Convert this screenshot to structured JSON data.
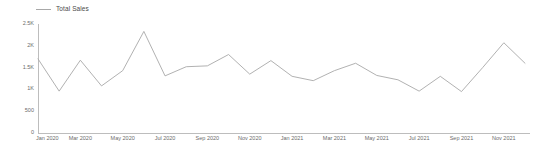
{
  "legend": {
    "position": "top-left",
    "entries": [
      {
        "label": "Total Sales",
        "color": "#a8a8a8",
        "marker": "line-swatch"
      }
    ]
  },
  "axes": {
    "y_ticks": [
      "2.5K",
      "2K",
      "1.5K",
      "1K",
      "500",
      "0"
    ],
    "y_tick_values": [
      2500,
      2000,
      1500,
      1000,
      500,
      0
    ],
    "x_ticks": [
      "Jan 2020",
      "Mar 2020",
      "May 2020",
      "Jul 2020",
      "Sep 2020",
      "Nov 2020",
      "Jan 2021",
      "Mar 2021",
      "May 2021",
      "Jul 2021",
      "Sep 2021",
      "Nov 2021"
    ]
  },
  "colors": {
    "series_line": "#a8a8a8",
    "axis": "#bdbdbd",
    "tick_text": "#6b6b6b",
    "legend_text": "#4a4a4a",
    "background": "#ffffff"
  },
  "chart_data": {
    "type": "line",
    "title": "",
    "subtitle": "",
    "xlabel": "",
    "ylabel": "",
    "ylim": [
      0,
      2500
    ],
    "grid": false,
    "legend_position": "top-left",
    "x": [
      "Jan 2020",
      "Feb 2020",
      "Mar 2020",
      "Apr 2020",
      "May 2020",
      "Jun 2020",
      "Jul 2020",
      "Aug 2020",
      "Sep 2020",
      "Oct 2020",
      "Nov 2020",
      "Dec 2020",
      "Jan 2021",
      "Feb 2021",
      "Mar 2021",
      "Apr 2021",
      "May 2021",
      "Jun 2021",
      "Jul 2021",
      "Aug 2021",
      "Sep 2021",
      "Oct 2021",
      "Nov 2021",
      "Dec 2021"
    ],
    "x_tick_labels": [
      "Jan 2020",
      "Mar 2020",
      "May 2020",
      "Jul 2020",
      "Sep 2020",
      "Nov 2020",
      "Jan 2021",
      "Mar 2021",
      "May 2021",
      "Jul 2021",
      "Sep 2021",
      "Nov 2021"
    ],
    "y_tick_labels": [
      "0",
      "500",
      "1K",
      "1.5K",
      "2K",
      "2.5K"
    ],
    "series": [
      {
        "name": "Total Sales",
        "color": "#a8a8a8",
        "values": [
          1700,
          960,
          1670,
          1080,
          1430,
          2330,
          1310,
          1520,
          1540,
          1800,
          1350,
          1660,
          1300,
          1200,
          1430,
          1600,
          1320,
          1220,
          960,
          1300,
          950,
          1500,
          2070,
          1600
        ]
      }
    ]
  }
}
